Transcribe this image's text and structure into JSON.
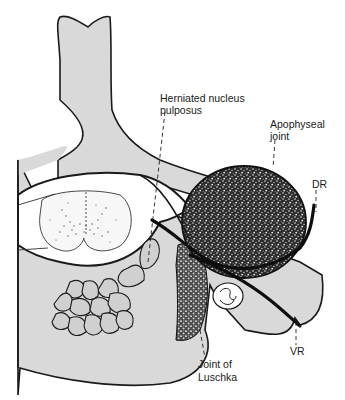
{
  "figure": {
    "labels": {
      "herniated": {
        "line1": "Herniated nucleus",
        "line2": "pulposus"
      },
      "apophyseal": {
        "line1": "Apophyseal",
        "line2": "joint"
      },
      "dr": "DR",
      "vr": "VR",
      "luschka": {
        "line1": "Joint of",
        "line2": "Luschka"
      }
    },
    "colors": {
      "bone": "#d9d9d9",
      "outline": "#1a1a1a",
      "background": "#ffffff",
      "joint_dark": "#2a2a2a"
    }
  }
}
